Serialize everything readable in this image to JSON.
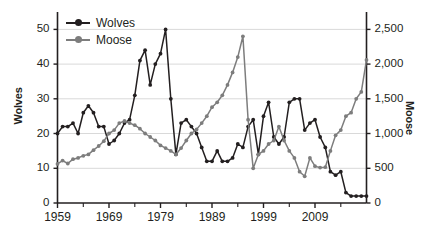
{
  "chart_data": {
    "type": "line",
    "title": "",
    "subtitle": "",
    "xlabel": "",
    "ylabel": "Wolves",
    "y2label": "Moose",
    "grid": true,
    "legend_position": "top-left",
    "xlim": [
      1959,
      2019
    ],
    "ylim": [
      0,
      55
    ],
    "y2lim": [
      0,
      2750
    ],
    "x_ticks_major": [
      "1959",
      "1969",
      "1979",
      "1989",
      "1999",
      "2009"
    ],
    "x_ticks_major_values": [
      1959,
      1969,
      1979,
      1989,
      1999,
      2009
    ],
    "x_ticks_minor_values": [
      1964,
      1974,
      1984,
      1994,
      2004,
      2014
    ],
    "y_ticks": [
      "0",
      "10",
      "20",
      "30",
      "40",
      "50"
    ],
    "y_tick_values": [
      0,
      10,
      20,
      30,
      40,
      50
    ],
    "y2_ticks": [
      "0",
      "500",
      "1,000",
      "1,500",
      "2,000",
      "2,500"
    ],
    "y2_tick_values": [
      0,
      500,
      1000,
      1500,
      2000,
      2500
    ],
    "colors": {
      "wolves": "#231f20",
      "moose": "#7d7d7d",
      "grid": "#d9d9d9",
      "axis": "#231f20",
      "background": "#ffffff"
    },
    "x": [
      1959,
      1960,
      1961,
      1962,
      1963,
      1964,
      1965,
      1966,
      1967,
      1968,
      1969,
      1970,
      1971,
      1972,
      1973,
      1974,
      1975,
      1976,
      1977,
      1978,
      1979,
      1980,
      1981,
      1982,
      1983,
      1984,
      1985,
      1986,
      1987,
      1988,
      1989,
      1990,
      1991,
      1992,
      1993,
      1994,
      1995,
      1996,
      1997,
      1998,
      1999,
      2000,
      2001,
      2002,
      2003,
      2004,
      2005,
      2006,
      2007,
      2008,
      2009,
      2010,
      2011,
      2012,
      2013,
      2014,
      2015,
      2016,
      2017,
      2018,
      2019
    ],
    "series": [
      {
        "name": "Wolves",
        "axis": "left",
        "color": "#231f20",
        "values": [
          20,
          22,
          22,
          23,
          20,
          26,
          28,
          26,
          22,
          22,
          17,
          18,
          20,
          23,
          24,
          31,
          41,
          44,
          34,
          40,
          43,
          50,
          30,
          14,
          23,
          24,
          22,
          20,
          16,
          12,
          12,
          15,
          12,
          12,
          13,
          17,
          16,
          22,
          24,
          14,
          25,
          29,
          19,
          17,
          19,
          29,
          30,
          30,
          21,
          23,
          24,
          19,
          16,
          9,
          8,
          9,
          3,
          2,
          2,
          2,
          2
        ]
      },
      {
        "name": "Moose",
        "axis": "right",
        "color": "#7d7d7d",
        "values": [
          563,
          610,
          568,
          630,
          650,
          680,
          700,
          760,
          820,
          890,
          1000,
          1050,
          1150,
          1180,
          1150,
          1120,
          1070,
          1000,
          950,
          900,
          830,
          790,
          750,
          700,
          790,
          900,
          1000,
          1060,
          1150,
          1250,
          1380,
          1450,
          1550,
          1700,
          1880,
          2100,
          2400,
          1200,
          500,
          700,
          750,
          850,
          900,
          1100,
          900,
          750,
          650,
          450,
          385,
          650,
          530,
          510,
          515,
          750,
          975,
          1050,
          1250,
          1300,
          1500,
          1600,
          2060
        ]
      }
    ]
  },
  "legend": {
    "items": [
      {
        "label": "Wolves",
        "color": "#231f20"
      },
      {
        "label": "Moose",
        "color": "#7d7d7d"
      }
    ]
  }
}
